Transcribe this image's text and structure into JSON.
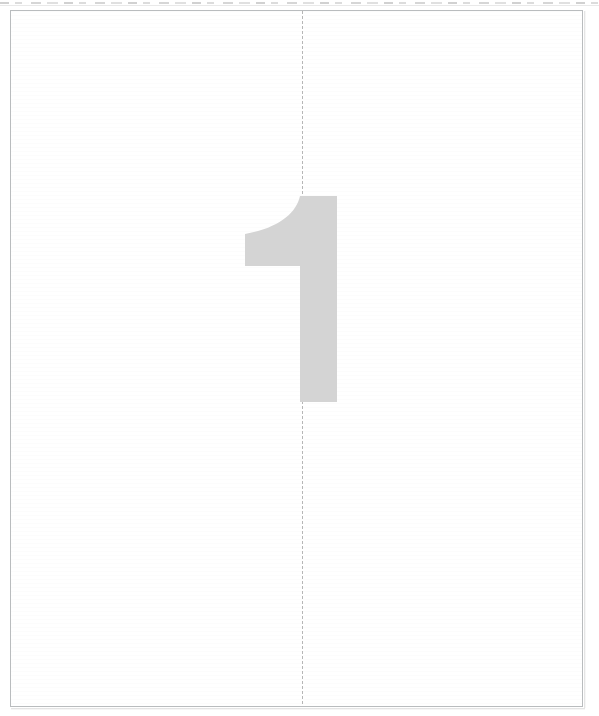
{
  "document": {
    "kind": "scanned-page",
    "page_label": "1",
    "background_color": "#ffffff",
    "sheet": {
      "border_color": "#b9bcbe",
      "border_width_px": 1,
      "left_px": 10,
      "top_px": 10,
      "width_px": 573,
      "height_px": 697
    }
  },
  "page_number_mark": {
    "text": "1",
    "color": "#d4d4d4",
    "left_px": 240,
    "top_px": 196,
    "width_px": 104,
    "height_px": 206,
    "style": "large-light-grey-sans-numeral"
  },
  "fold_guide": {
    "orientation": "vertical",
    "color": "#b6b6b6",
    "x_px": 302,
    "dash": "dotted",
    "spans_full_page_height": true
  },
  "scan_artifacts": {
    "top_edge_dashes": {
      "color": "#cfcfcf",
      "y_px": 2
    },
    "top_edge_hairline": {
      "color": "#e9e9e9",
      "y_px": 5
    },
    "paper_banding": {
      "color": "rgba(0,0,0,0.01)"
    },
    "right_shadow": {
      "color": "#dcdcdc"
    },
    "bottom_shadow": {
      "color": "#dcdcdc"
    }
  },
  "accessibility": {
    "caption": "Blank scanned page with a large light grey numeral 1 and a vertical dotted centre guide line."
  }
}
